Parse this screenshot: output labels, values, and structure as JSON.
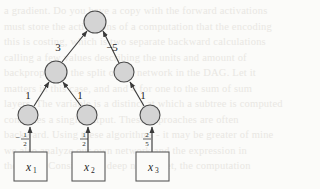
{
  "page": {
    "background_color": "#fbfbf9",
    "ghost_text": "a gradient. Do you have a copy with the forward activations\nmust store the activations of a computation that the encoding\nthis is costing, which is two separate backward calculations\ncalling a few values describing the units and amount of\nbackpropagate the split of the network in the DAG. Let it\nmatters in this case, and and 4 for one to the sum of sum\nlayers. The variable is a distinct at which a subtree is computed\ncomputes a single output. These approaches are often\nbackward. Using these algorithms - it may be greater of mine\nwe also analyze our own network and the expression in\nthe same. Consider the deep neural net, the computation"
  },
  "diagram": {
    "node_fill": "#d4d4d4",
    "node_stroke": "#4a4a4a",
    "edge_color": "#3a3a3a",
    "nodes": [
      {
        "id": "root",
        "name": "root-node",
        "cx": 95,
        "cy": 22,
        "r": 11
      },
      {
        "id": "mid-left",
        "name": "mid-left-node",
        "cx": 56,
        "cy": 72,
        "r": 11
      },
      {
        "id": "mid-right",
        "name": "mid-right-node",
        "cx": 124,
        "cy": 72,
        "r": 10
      },
      {
        "id": "leaf-1",
        "name": "leaf-node-1",
        "cx": 28,
        "cy": 115,
        "r": 10
      },
      {
        "id": "leaf-2",
        "name": "leaf-node-2",
        "cx": 87,
        "cy": 115,
        "r": 10
      },
      {
        "id": "leaf-3",
        "name": "leaf-node-3",
        "cx": 150,
        "cy": 115,
        "r": 10
      }
    ],
    "edges": [
      {
        "id": "e-midleft-root",
        "name": "edge-mid-left-to-root",
        "label": "3",
        "label_x": 58,
        "label_y": 51
      },
      {
        "id": "e-midright-root",
        "name": "edge-mid-right-to-root",
        "label": "−5",
        "label_x": 107,
        "label_y": 51
      },
      {
        "id": "e-leaf1-midleft",
        "name": "edge-leaf-1-to-mid-left",
        "label": "1",
        "label_x": 28,
        "label_y": 99
      },
      {
        "id": "e-leaf2-midleft",
        "name": "edge-leaf-2-to-mid-left",
        "label": "1",
        "label_x": 80,
        "label_y": 99
      },
      {
        "id": "e-leaf3-midright",
        "name": "edge-leaf-3-to-mid-right",
        "label": "1",
        "label_x": 143,
        "label_y": 99
      }
    ],
    "input_edges": [
      {
        "id": "ie-1",
        "name": "edge-x1-to-leaf-1",
        "sign": "−",
        "numerator": "1",
        "denominator": "2",
        "label_x": 25,
        "label_y": 139
      },
      {
        "id": "ie-2",
        "name": "edge-x2-to-leaf-2",
        "sign": "",
        "numerator": "1",
        "denominator": "2",
        "label_x": 84,
        "label_y": 139
      },
      {
        "id": "ie-3",
        "name": "edge-x3-to-leaf-3",
        "sign": "",
        "numerator": "2",
        "denominator": "5",
        "label_x": 147,
        "label_y": 139
      }
    ],
    "input_boxes": [
      {
        "id": "x1",
        "name": "input-box-x1",
        "base": "x",
        "sub": "1",
        "x": 14,
        "y": 152,
        "w": 33,
        "h": 29
      },
      {
        "id": "x2",
        "name": "input-box-x2",
        "base": "x",
        "sub": "2",
        "x": 72,
        "y": 152,
        "w": 33,
        "h": 29
      },
      {
        "id": "x3",
        "name": "input-box-x3",
        "base": "x",
        "sub": "3",
        "x": 136,
        "y": 152,
        "w": 33,
        "h": 29
      }
    ]
  }
}
